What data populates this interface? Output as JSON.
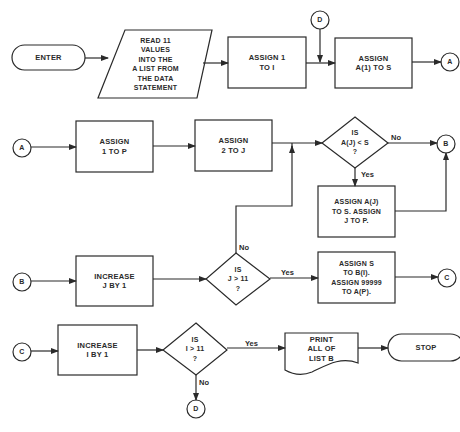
{
  "diagram": {
    "type": "flowchart",
    "nodes": {
      "enter": {
        "shape": "terminal",
        "label": "ENTER"
      },
      "read_values": {
        "shape": "input-output",
        "label": "READ 11\nVALUES\nINTO THE\nA  LIST FROM\nTHE DATA\nSTATEMENT"
      },
      "assign_1_to_i": {
        "shape": "process",
        "label": "ASSIGN 1\nTO I"
      },
      "assign_a1_to_s": {
        "shape": "process",
        "label": "ASSIGN\nA(1) TO S"
      },
      "assign_1_to_p": {
        "shape": "process",
        "label": "ASSIGN\n1 TO P"
      },
      "assign_2_to_j": {
        "shape": "process",
        "label": "ASSIGN\n2 TO J"
      },
      "decision_aj_lt_s": {
        "shape": "decision",
        "label": "IS\nA(J) < S\n?"
      },
      "assign_aj_to_s": {
        "shape": "process",
        "label": "ASSIGN A(J)\nTO S.  ASSIGN\nJ TO P."
      },
      "increase_j": {
        "shape": "process",
        "label": "INCREASE\nJ BY 1"
      },
      "decision_j_gt_11": {
        "shape": "decision",
        "label": "IS\nJ > 11\n?"
      },
      "assign_s_to_bi": {
        "shape": "process",
        "label": "ASSIGN S\nTO B(I).\nASSIGN 99999\nTO A(P)."
      },
      "increase_i": {
        "shape": "process",
        "label": "INCREASE\nI BY 1"
      },
      "decision_i_gt_11": {
        "shape": "decision",
        "label": "IS\nI > 11\n?"
      },
      "print_list_b": {
        "shape": "document",
        "label": "PRINT\nALL OF\nLIST B"
      },
      "stop": {
        "shape": "terminal",
        "label": "STOP"
      }
    },
    "connectors": {
      "d_top": "D",
      "a_out": "A",
      "a_in": "A",
      "b_out": "B",
      "b_in": "B",
      "c_out": "C",
      "c_in": "C",
      "d_bottom": "D"
    },
    "edge_labels": {
      "aj_no": "No",
      "aj_yes": "Yes",
      "j_no": "No",
      "j_yes": "Yes",
      "i_yes": "Yes",
      "i_no": "No"
    },
    "colors": {
      "stroke": "#2a2a2a",
      "background": "#ffffff"
    }
  }
}
